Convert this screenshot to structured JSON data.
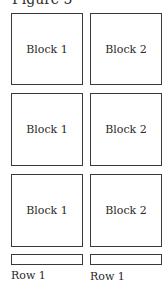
{
  "figure": {
    "title": "Figure 5"
  },
  "grid": {
    "rows": [
      {
        "blocks": [
          {
            "label": "Block 1"
          },
          {
            "label": "Block 2"
          }
        ]
      },
      {
        "blocks": [
          {
            "label": "Block 1"
          },
          {
            "label": "Block 2"
          }
        ]
      },
      {
        "blocks": [
          {
            "label": "Block 1"
          },
          {
            "label": "Block 2"
          }
        ]
      }
    ]
  },
  "footer": {
    "bars": [
      {
        "label": "Row 1"
      },
      {
        "label": "Row 1"
      }
    ]
  },
  "colors": {
    "stroke": "#3a3a3a",
    "text": "#2a2a2a",
    "background": "#ffffff"
  }
}
